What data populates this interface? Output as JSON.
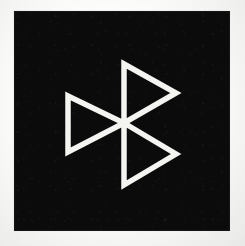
{
  "image": {
    "kind": "logo-mark-photograph",
    "subject": "three-triangle pinwheel emblem",
    "canvas_width": 245,
    "canvas_height": 246,
    "background_color": "#fdfdfc",
    "alt_text": "Square black plate bearing three white outlined triangles arranged in 120-degree rotational symmetry around a common center point"
  },
  "plate": {
    "shape": "square",
    "fill_color": "#0b0b0b",
    "x": 14,
    "y": 11,
    "width": 216,
    "height": 220
  },
  "mark": {
    "name": "triangle-trefoil-mark",
    "stroke_color": "#f4f4f1",
    "stroke_width": 5.5,
    "center_x": 124,
    "center_y": 123,
    "symmetry": "3-fold rotational (120 degrees)",
    "triangle_count": 3,
    "triangles": [
      {
        "id": "triangle-upper-right",
        "label": "upper right triangle",
        "rotation_deg": 0,
        "points": "124,64 176,93 124,123"
      },
      {
        "id": "triangle-lower-right",
        "label": "lower right triangle",
        "rotation_deg": 120,
        "points": "124,123 176,154 124,185"
      },
      {
        "id": "triangle-left",
        "label": "left triangle",
        "rotation_deg": 240,
        "points": "68,96 124,123 68,152"
      }
    ]
  },
  "colors": {
    "ink_black": "#0b0b0b",
    "ink_white": "#f4f4f1",
    "paper": "#fdfdfc"
  }
}
